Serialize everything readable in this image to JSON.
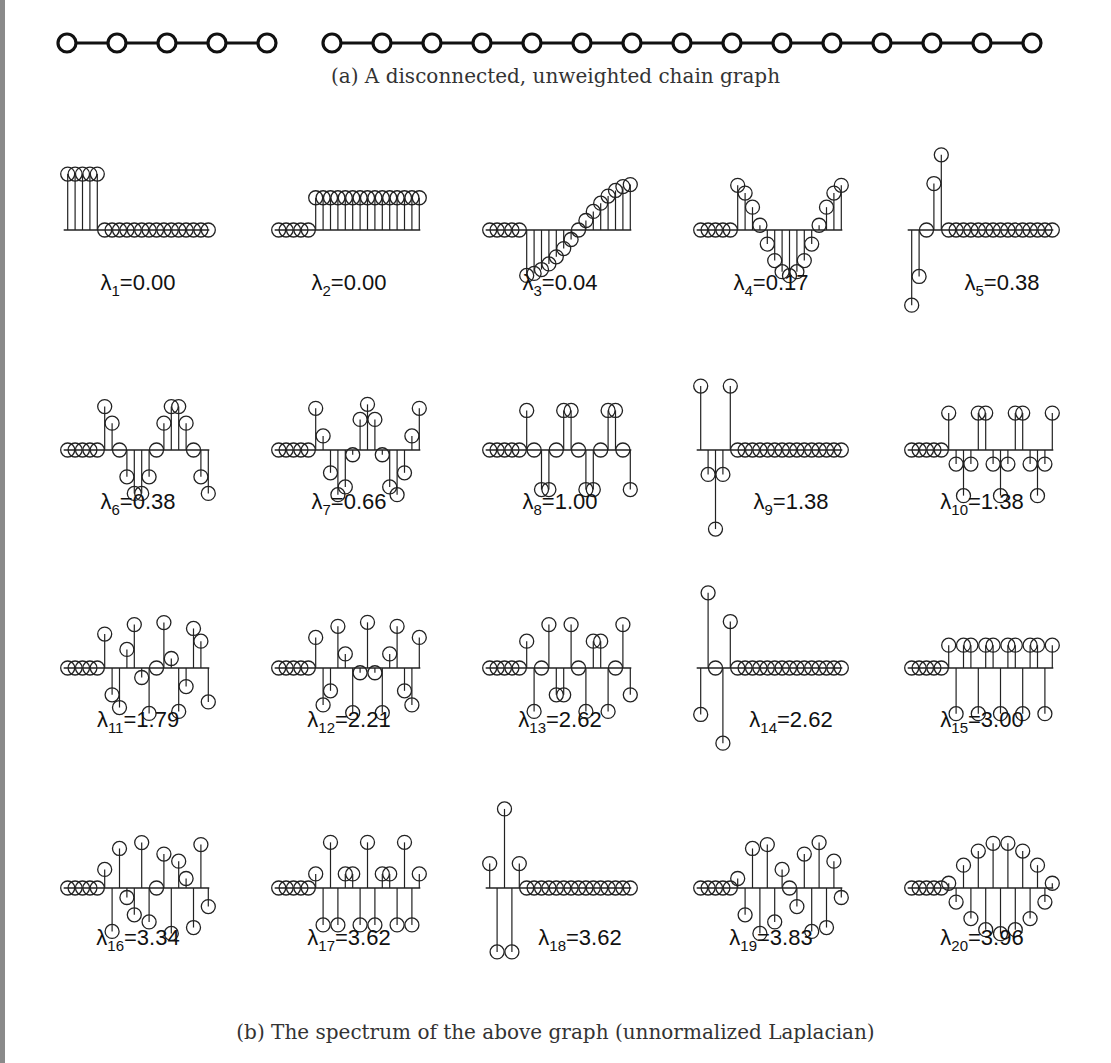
{
  "figure": {
    "caption_a": "(a) A disconnected, unweighted chain graph",
    "caption_b": "(b) The spectrum of the above graph (unnormalized Laplacian)"
  },
  "graph": {
    "components": [
      {
        "name": "chain-A",
        "nodes": 5
      },
      {
        "name": "chain-B",
        "nodes": 15
      }
    ],
    "node_icon": "open-circle-icon",
    "edge_style": "solid-line"
  },
  "chart_data": {
    "type": "stem",
    "title": "The spectrum of the above graph (unnormalized Laplacian)",
    "xlabel": "",
    "ylabel": "",
    "grid": false,
    "layout": {
      "rows": 4,
      "cols": 5
    },
    "num_vertices": 20,
    "panels": [
      {
        "index": 1,
        "sub": "1",
        "value": "0.00",
        "label_text": "=0.00",
        "component": "A",
        "mode": 0,
        "sign": 1
      },
      {
        "index": 2,
        "sub": "2",
        "value": "0.00",
        "label_text": "=0.00",
        "component": "B",
        "mode": 0,
        "sign": 1
      },
      {
        "index": 3,
        "sub": "3",
        "value": "0.04",
        "label_text": "=0.04",
        "component": "B",
        "mode": 1,
        "sign": -1
      },
      {
        "index": 4,
        "sub": "4",
        "value": "0.17",
        "label_text": "=0.17",
        "component": "B",
        "mode": 2,
        "sign": 1
      },
      {
        "index": 5,
        "sub": "5",
        "value": "0.38",
        "label_text": "=0.38",
        "component": "A",
        "mode": 1,
        "sign": -1
      },
      {
        "index": 6,
        "sub": "6",
        "value": "0.38",
        "label_text": "=0.38",
        "component": "B",
        "mode": 3,
        "sign": 1
      },
      {
        "index": 7,
        "sub": "7",
        "value": "0.66",
        "label_text": "=0.66",
        "component": "B",
        "mode": 4,
        "sign": 1
      },
      {
        "index": 8,
        "sub": "8",
        "value": "1.00",
        "label_text": "=1.00",
        "component": "B",
        "mode": 5,
        "sign": 1
      },
      {
        "index": 9,
        "sub": "9",
        "value": "1.38",
        "label_text": "=1.38",
        "component": "A",
        "mode": 2,
        "sign": 1
      },
      {
        "index": 10,
        "sub": "10",
        "value": "1.38",
        "label_text": "=1.38",
        "component": "B",
        "mode": 6,
        "sign": 1
      },
      {
        "index": 11,
        "sub": "11",
        "value": "1.79",
        "label_text": "=1.79",
        "component": "B",
        "mode": 7,
        "sign": 1
      },
      {
        "index": 12,
        "sub": "12",
        "value": "2.21",
        "label_text": "=2.21",
        "component": "B",
        "mode": 8,
        "sign": 1
      },
      {
        "index": 13,
        "sub": "13",
        "value": "2.62",
        "label_text": "=2.62",
        "component": "B",
        "mode": 9,
        "sign": 1
      },
      {
        "index": 14,
        "sub": "14",
        "value": "2.62",
        "label_text": "=2.62",
        "component": "A",
        "mode": 3,
        "sign": -1
      },
      {
        "index": 15,
        "sub": "15",
        "value": "3.00",
        "label_text": "=3.00",
        "component": "B",
        "mode": 10,
        "sign": 1
      },
      {
        "index": 16,
        "sub": "16",
        "value": "3.34",
        "label_text": "=3.34",
        "component": "B",
        "mode": 11,
        "sign": 1
      },
      {
        "index": 17,
        "sub": "17",
        "value": "3.62",
        "label_text": "=3.62",
        "component": "B",
        "mode": 12,
        "sign": 1
      },
      {
        "index": 18,
        "sub": "18",
        "value": "3.62",
        "label_text": "=3.62",
        "component": "A",
        "mode": 4,
        "sign": 1
      },
      {
        "index": 19,
        "sub": "19",
        "value": "3.83",
        "label_text": "=3.83",
        "component": "B",
        "mode": 13,
        "sign": 1
      },
      {
        "index": 20,
        "sub": "20",
        "value": "3.96",
        "label_text": "=3.96",
        "component": "B",
        "mode": 14,
        "sign": 1
      }
    ],
    "eigenvalues": [
      0.0,
      0.0,
      0.04,
      0.17,
      0.38,
      0.38,
      0.66,
      1.0,
      1.38,
      1.38,
      1.79,
      2.21,
      2.62,
      2.62,
      3.0,
      3.34,
      3.62,
      3.62,
      3.83,
      3.96
    ],
    "legend": null
  },
  "labels": {
    "lambda_symbol": "λ"
  }
}
